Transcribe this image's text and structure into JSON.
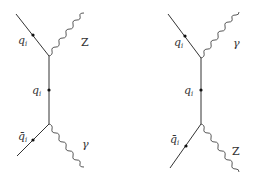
{
  "diagrams": [
    {
      "name": "left",
      "top_in_label": "q",
      "top_in_sub": "i",
      "propagator_label": "q",
      "propagator_sub": "i",
      "bottom_in_label": "q̄",
      "bottom_in_sub": "i",
      "top_boson_label": "Z",
      "bottom_boson_label": "γ"
    },
    {
      "name": "right",
      "top_in_label": "q",
      "top_in_sub": "i",
      "propagator_label": "q",
      "propagator_sub": "i",
      "bottom_in_label": "q̄",
      "bottom_in_sub": "i",
      "top_boson_label": "γ",
      "bottom_boson_label": "Z"
    }
  ]
}
